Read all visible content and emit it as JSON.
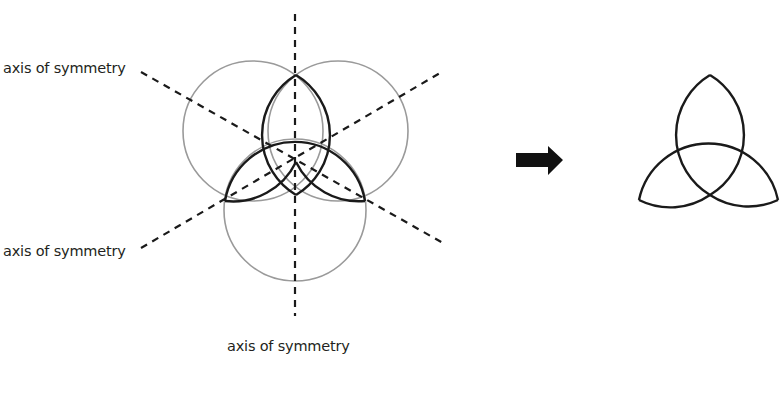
{
  "labels": {
    "upper_left": "axis of symmetry",
    "lower_left": "axis of symmetry",
    "bottom": "axis of symmetry"
  },
  "colors": {
    "background": "#ffffff",
    "ink": "#1a1a1a",
    "construction_circle": "#999999",
    "label_text": "#231f20"
  },
  "figures": {
    "left": "three overlapping circles with three dashed axes of symmetry",
    "arrow": "right-pointing arrow",
    "right": "resulting triquetra shape"
  }
}
